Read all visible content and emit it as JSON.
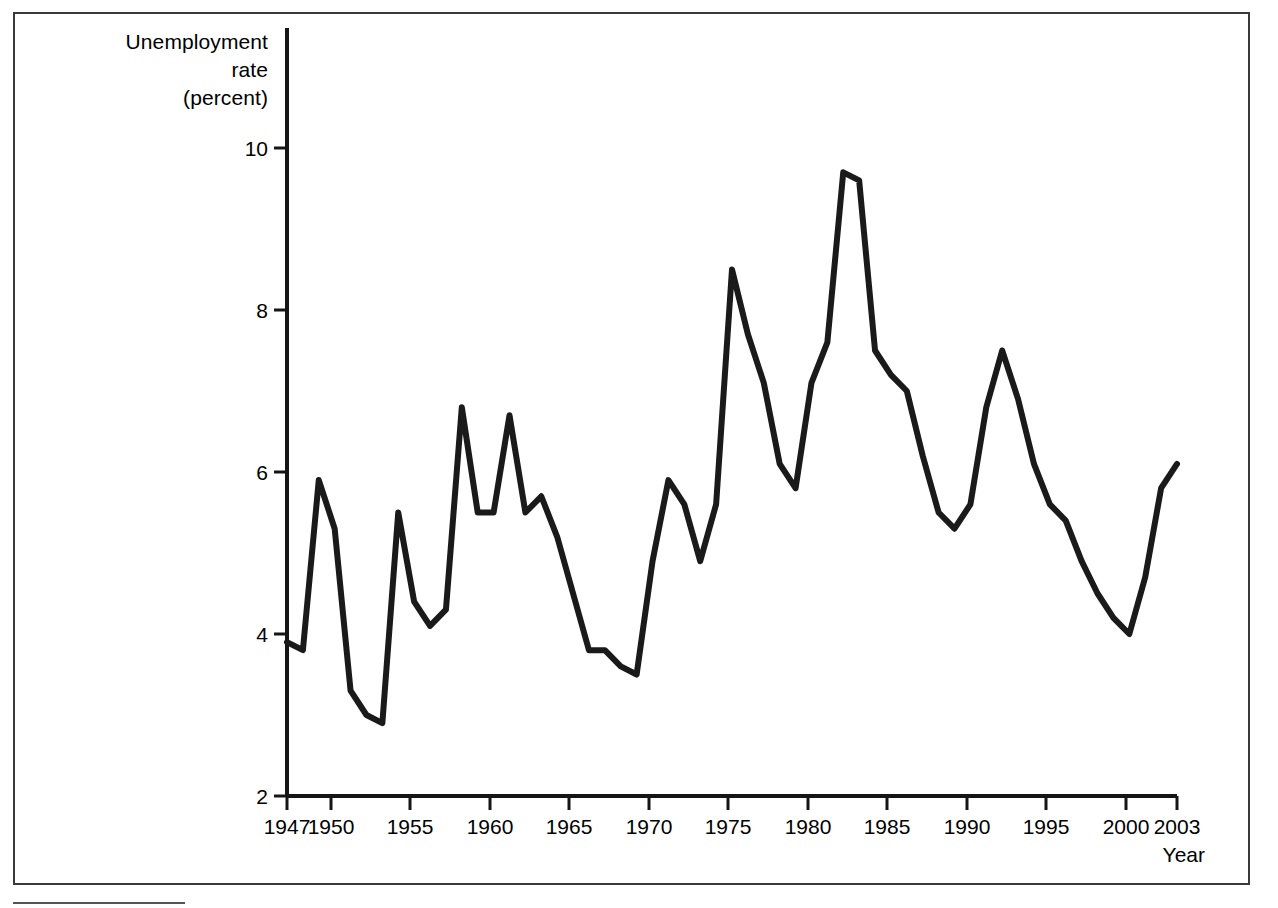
{
  "figure": {
    "frame_border_color": "#3a3a3a",
    "background": "#ffffff",
    "line_color": "#1a1a1a"
  },
  "axis": {
    "y_title_line1": "Unemployment",
    "y_title_line2": "rate",
    "y_title_line3": "(percent)",
    "x_title": "Year",
    "y_ticks": [
      "2",
      "4",
      "6",
      "8",
      "10"
    ],
    "x_ticks": [
      "1947",
      "1950",
      "1955",
      "1960",
      "1965",
      "1970",
      "1975",
      "1980",
      "1985",
      "1990",
      "1995",
      "2000",
      "2003"
    ]
  },
  "chart_data": {
    "type": "line",
    "title": "",
    "xlabel": "Year",
    "ylabel": "Unemployment rate (percent)",
    "xlim": [
      1947,
      2003
    ],
    "ylim": [
      2,
      10
    ],
    "grid": false,
    "legend": "none",
    "x": [
      1947,
      1948,
      1949,
      1950,
      1951,
      1952,
      1953,
      1954,
      1955,
      1956,
      1957,
      1958,
      1959,
      1960,
      1961,
      1962,
      1963,
      1964,
      1965,
      1966,
      1967,
      1968,
      1969,
      1970,
      1971,
      1972,
      1973,
      1974,
      1975,
      1976,
      1977,
      1978,
      1979,
      1980,
      1981,
      1982,
      1983,
      1984,
      1985,
      1986,
      1987,
      1988,
      1989,
      1990,
      1991,
      1992,
      1993,
      1994,
      1995,
      1996,
      1997,
      1998,
      1999,
      2000,
      2001,
      2002,
      2003
    ],
    "values": [
      3.9,
      3.8,
      5.9,
      5.3,
      3.3,
      3.0,
      2.9,
      5.5,
      4.4,
      4.1,
      4.3,
      6.8,
      5.5,
      5.5,
      6.7,
      5.5,
      5.7,
      5.2,
      4.5,
      3.8,
      3.8,
      3.6,
      3.5,
      4.9,
      5.9,
      5.6,
      4.9,
      5.6,
      8.5,
      7.7,
      7.1,
      6.1,
      5.8,
      7.1,
      7.6,
      9.7,
      9.6,
      7.5,
      7.2,
      7.0,
      6.2,
      5.5,
      5.3,
      5.6,
      6.8,
      7.5,
      6.9,
      6.1,
      5.6,
      5.4,
      4.9,
      4.5,
      4.2,
      4.0,
      4.7,
      5.8,
      6.1
    ],
    "series": [
      {
        "name": "Civilian unemployment rate",
        "values": [
          3.9,
          3.8,
          5.9,
          5.3,
          3.3,
          3.0,
          2.9,
          5.5,
          4.4,
          4.1,
          4.3,
          6.8,
          5.5,
          5.5,
          6.7,
          5.5,
          5.7,
          5.2,
          4.5,
          3.8,
          3.8,
          3.6,
          3.5,
          4.9,
          5.9,
          5.6,
          4.9,
          5.6,
          8.5,
          7.7,
          7.1,
          6.1,
          5.8,
          7.1,
          7.6,
          9.7,
          9.6,
          7.5,
          7.2,
          7.0,
          6.2,
          5.5,
          5.3,
          5.6,
          6.8,
          7.5,
          6.9,
          6.1,
          5.6,
          5.4,
          4.9,
          4.5,
          4.2,
          4.0,
          4.7,
          5.8,
          6.1
        ]
      }
    ]
  },
  "geometry": {
    "plot_left": 287,
    "plot_right": 1177,
    "y_for_2": 796,
    "y_for_10": 148
  }
}
